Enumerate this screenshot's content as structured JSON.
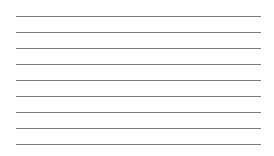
{
  "sheet": {
    "type": "ruled-lines",
    "line_count": 9,
    "line_color": "#7a7a7a",
    "background": "#ffffff",
    "lines": [
      {
        "y": 16
      },
      {
        "y": 32
      },
      {
        "y": 48
      },
      {
        "y": 64
      },
      {
        "y": 80
      },
      {
        "y": 96
      },
      {
        "y": 112
      },
      {
        "y": 128
      },
      {
        "y": 144
      }
    ]
  }
}
